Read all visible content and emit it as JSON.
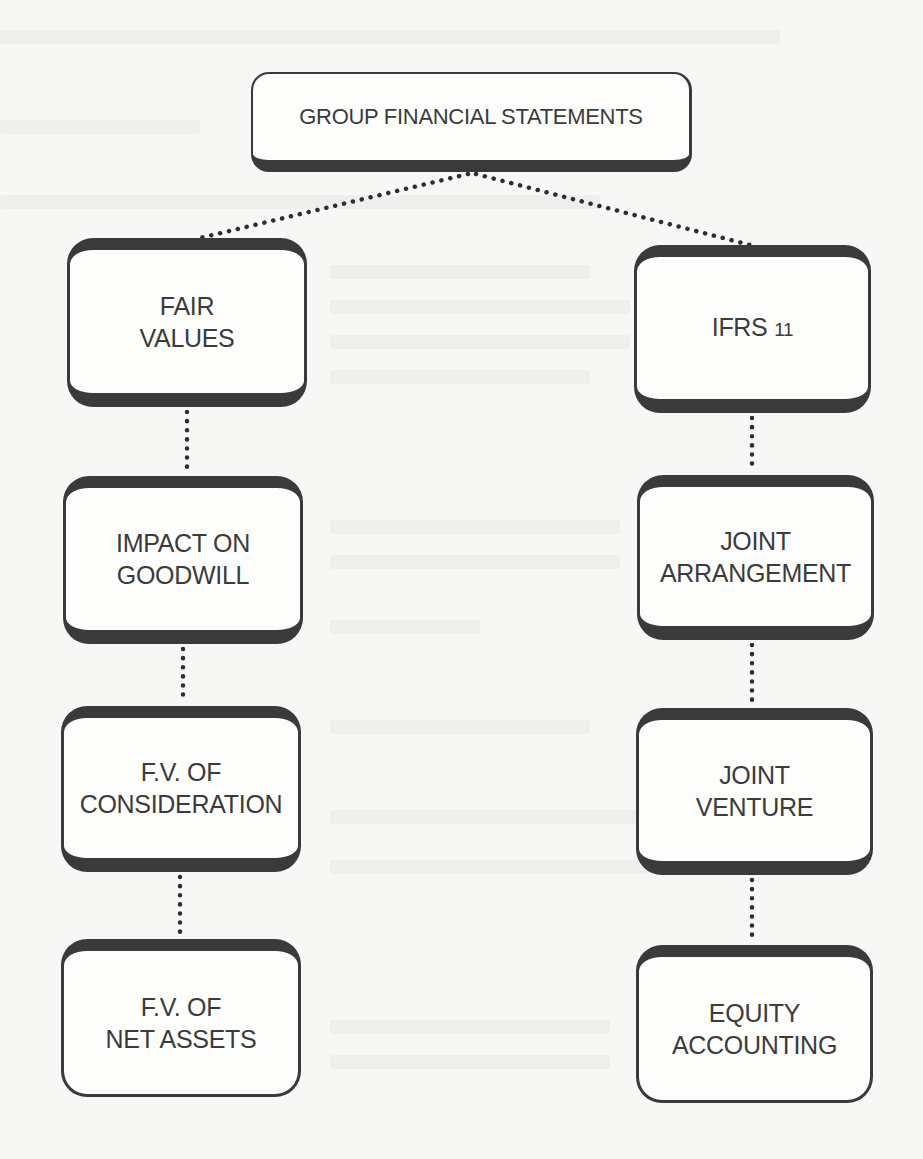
{
  "diagram": {
    "title": "GROUP FINANCIAL STATEMENTS",
    "colors": {
      "box_border": "#3a3a3a",
      "box_fill": "#fdfdfc",
      "text": "#3b3b3b",
      "connector": "#2e2e2e",
      "background": "#f7f7f5"
    },
    "connector_style": "dotted",
    "left_branch": {
      "nodes": [
        {
          "id": "fair-values",
          "line1": "FAIR",
          "line2": "VALUES"
        },
        {
          "id": "impact-on-goodwill",
          "line1": "IMPACT ON",
          "line2": "GOODWILL"
        },
        {
          "id": "fv-of-consideration",
          "line1": "F.V. OF",
          "line2": "CONSIDERATION"
        },
        {
          "id": "fv-of-net-assets",
          "line1": "F.V. OF",
          "line2": "NET ASSETS"
        }
      ]
    },
    "right_branch": {
      "nodes": [
        {
          "id": "ifrs-11",
          "line1": "IFRS",
          "line1_num": "11",
          "line2": ""
        },
        {
          "id": "joint-arrangement",
          "line1": "JOINT",
          "line2": "ARRANGEMENT"
        },
        {
          "id": "joint-venture",
          "line1": "JOINT",
          "line2": "VENTURE"
        },
        {
          "id": "equity-accounting",
          "line1": "EQUITY",
          "line2": "ACCOUNTING"
        }
      ]
    },
    "edges": [
      {
        "from": "root",
        "to": "fair-values"
      },
      {
        "from": "root",
        "to": "ifrs-11"
      },
      {
        "from": "fair-values",
        "to": "impact-on-goodwill"
      },
      {
        "from": "impact-on-goodwill",
        "to": "fv-of-consideration"
      },
      {
        "from": "fv-of-consideration",
        "to": "fv-of-net-assets"
      },
      {
        "from": "ifrs-11",
        "to": "joint-arrangement"
      },
      {
        "from": "joint-arrangement",
        "to": "joint-venture"
      },
      {
        "from": "joint-venture",
        "to": "equity-accounting"
      }
    ]
  }
}
